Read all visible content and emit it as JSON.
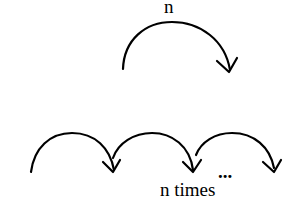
{
  "top": {
    "label": "n"
  },
  "bottom": {
    "ellipsis": "...",
    "label": "n times"
  }
}
